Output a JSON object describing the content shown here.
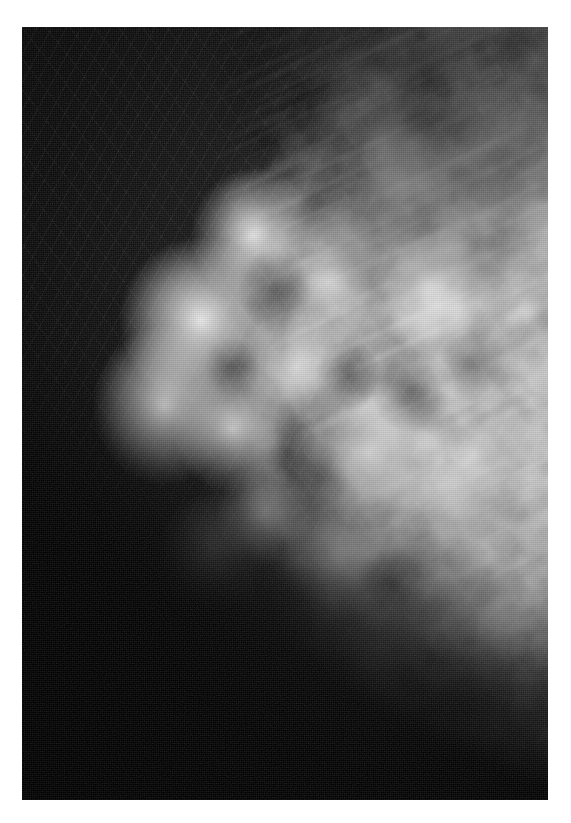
{
  "document": {
    "type": "radiograph",
    "modality": "mammogram",
    "title": "",
    "caption": "",
    "labels": [],
    "annotations": [],
    "visible_text": []
  },
  "page": {
    "width": 571,
    "height": 823,
    "background_color": "#ffffff",
    "margin_left": 22,
    "margin_top": 27,
    "margin_right": 23,
    "margin_bottom": 23
  },
  "plate": {
    "x": 22,
    "y": 27,
    "width": 526,
    "height": 773,
    "background_color": "#080808",
    "alt": "Grayscale mammographic X-ray film showing a breast in profile against a black background, with heterogeneously dense fibroglandular tissue."
  },
  "image_content": {
    "subject": "breast",
    "orientation": "profile, chest wall at right, anterior skin border curving along the left",
    "regions": [
      {
        "name": "air-background",
        "description": "unexposed black film surrounding the breast, occupying the left and lower-left of the frame",
        "tone": "#080808"
      },
      {
        "name": "skin-line",
        "description": "thin brighter rim tracing the convex anterior breast border",
        "tone": "#8c8c8c"
      },
      {
        "name": "subcutaneous-fat",
        "description": "darker band just beneath the skin line along the anterior margin",
        "tone": "#3a3a3a"
      },
      {
        "name": "fibroglandular-tissue",
        "description": "bright cloud-like mottled parenchyma filling the centre and upper-left of the breast",
        "tone": "#e6e6e6"
      },
      {
        "name": "fatty-tissue",
        "description": "dark lobulated areas interspersed through the parenchyma and along the superior margin",
        "tone": "#4a4a4a"
      },
      {
        "name": "coopers-ligaments",
        "description": "fine bright linear strands running obliquely across the upper field",
        "tone": "#c8c8c8"
      },
      {
        "name": "pectoral-chest-wall",
        "description": "broad grey shading entering from the upper-right corner",
        "tone": "#6e6e6e"
      },
      {
        "name": "inferior-fat-wedge",
        "description": "dark diagonal wedge along the inferior breast border in the lower-left",
        "tone": "#101010"
      }
    ],
    "palette": {
      "black": "#080808",
      "dark_gray": "#2a2a2a",
      "mid_gray": "#787878",
      "light_gray": "#bcbcbc",
      "white": "#f2f2f2",
      "page_white": "#ffffff"
    }
  }
}
